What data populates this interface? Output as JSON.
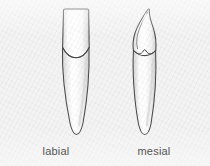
{
  "figure": {
    "name": "tooth-anatomy-two-views",
    "background_color": "#f3f3f3",
    "outline_color": "#4a4a4a",
    "enamel_fill": "#ffffff",
    "shadow_color": "#c9c9c9",
    "caption_color": "#545454"
  },
  "views": [
    {
      "id": "labial",
      "label": "labial",
      "description": "labial (facial) view of tooth: trapezoidal crown tapering toward the cervix, curved cervical line, single long tapering root with rounded apex"
    },
    {
      "id": "mesial",
      "label": "mesial",
      "description": "mesial (proximal) view of tooth: hooked pointed crown curving toward the incisal tip, V-shaped cervical line, long tapering root with rounded apex"
    }
  ],
  "captions": {
    "left": "labial",
    "right": "mesial"
  }
}
